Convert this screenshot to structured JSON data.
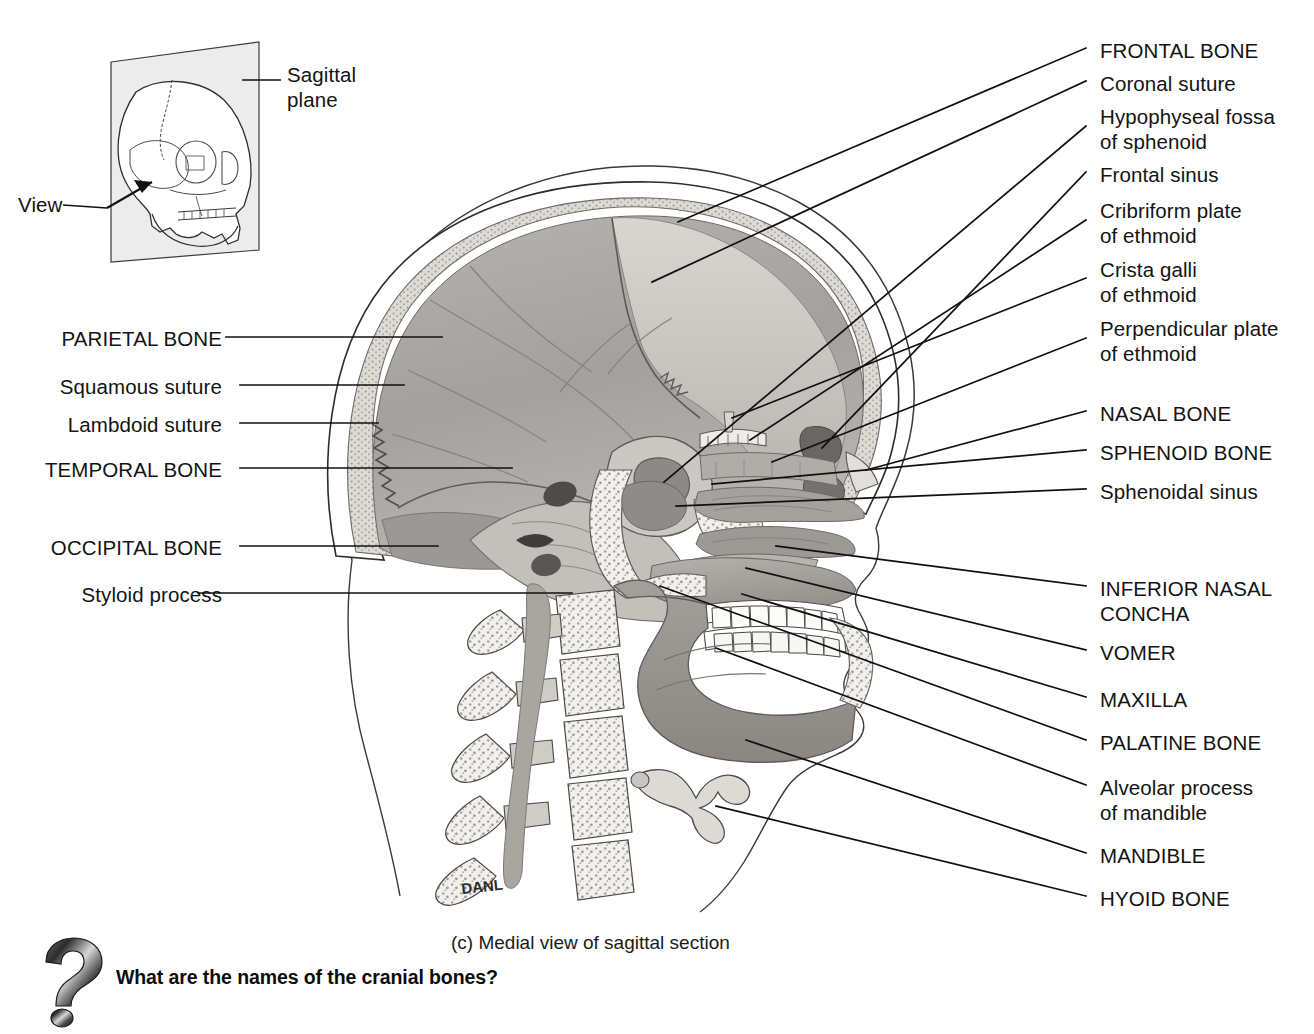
{
  "figure": {
    "caption": "(c) Medial view of sagittal section",
    "artist_signature": "DANL",
    "question_prompt": "What are the names of the cranial bones?",
    "question_icon": "question-mark-icon"
  },
  "inset": {
    "name": "orientation-inset",
    "plane_label": "Sagittal\nplane",
    "view_label": "View"
  },
  "labels_right": [
    {
      "id": "frontal-bone",
      "text": "FRONTAL BONE",
      "emphasis": "caps",
      "y": 38,
      "lines": 1
    },
    {
      "id": "coronal-suture",
      "text": "Coronal suture",
      "emphasis": "normal",
      "y": 71,
      "lines": 1
    },
    {
      "id": "hypophyseal-fossa",
      "text": "Hypophyseal fossa\nof sphenoid",
      "emphasis": "normal",
      "y": 104,
      "lines": 2
    },
    {
      "id": "frontal-sinus",
      "text": "Frontal sinus",
      "emphasis": "normal",
      "y": 162,
      "lines": 1
    },
    {
      "id": "cribriform-plate",
      "text": "Cribriform plate\nof ethmoid",
      "emphasis": "normal",
      "y": 198,
      "lines": 2
    },
    {
      "id": "crista-galli",
      "text": "Crista galli\nof ethmoid",
      "emphasis": "normal",
      "y": 257,
      "lines": 2
    },
    {
      "id": "perpendicular-plate",
      "text": "Perpendicular plate\nof ethmoid",
      "emphasis": "normal",
      "y": 316,
      "lines": 2
    },
    {
      "id": "nasal-bone",
      "text": "NASAL BONE",
      "emphasis": "caps",
      "y": 401,
      "lines": 1
    },
    {
      "id": "sphenoid-bone",
      "text": "SPHENOID BONE",
      "emphasis": "caps",
      "y": 440,
      "lines": 1
    },
    {
      "id": "sphenoidal-sinus",
      "text": "Sphenoidal sinus",
      "emphasis": "normal",
      "y": 479,
      "lines": 1
    },
    {
      "id": "inferior-nasal-concha",
      "text": "INFERIOR NASAL\nCONCHA",
      "emphasis": "caps",
      "y": 576,
      "lines": 2
    },
    {
      "id": "vomer",
      "text": "VOMER",
      "emphasis": "caps",
      "y": 640,
      "lines": 1
    },
    {
      "id": "maxilla",
      "text": "MAXILLA",
      "emphasis": "caps",
      "y": 687,
      "lines": 1
    },
    {
      "id": "palatine-bone",
      "text": "PALATINE BONE",
      "emphasis": "caps",
      "y": 730,
      "lines": 1
    },
    {
      "id": "alveolar-process",
      "text": "Alveolar process\nof mandible",
      "emphasis": "normal",
      "y": 775,
      "lines": 2
    },
    {
      "id": "mandible",
      "text": "MANDIBLE",
      "emphasis": "caps",
      "y": 843,
      "lines": 1
    },
    {
      "id": "hyoid-bone",
      "text": "HYOID BONE",
      "emphasis": "caps",
      "y": 886,
      "lines": 1
    }
  ],
  "labels_left": [
    {
      "id": "parietal-bone",
      "text": "PARIETAL BONE",
      "emphasis": "caps",
      "y": 326
    },
    {
      "id": "squamous-suture",
      "text": "Squamous suture",
      "emphasis": "normal",
      "y": 374
    },
    {
      "id": "lambdoid-suture",
      "text": "Lambdoid suture",
      "emphasis": "normal",
      "y": 412
    },
    {
      "id": "temporal-bone",
      "text": "TEMPORAL BONE",
      "emphasis": "caps",
      "y": 457
    },
    {
      "id": "occipital-bone",
      "text": "OCCIPITAL BONE",
      "emphasis": "caps",
      "y": 535
    },
    {
      "id": "styloid-process",
      "text": "Styloid process",
      "emphasis": "normal",
      "y": 582
    }
  ],
  "colors": {
    "ink": "#131313",
    "leader_line": "#101010",
    "bone_light": "#e8e6e3",
    "bone_mid": "#bdb9b6",
    "bone_dark": "#8e8a87",
    "cavity_gray": "#9a9794",
    "brain_case": "#a9a5a2",
    "diploe": "#d6d2cd",
    "tooth": "#fbfbf9",
    "outline": "#2a2a2a"
  }
}
